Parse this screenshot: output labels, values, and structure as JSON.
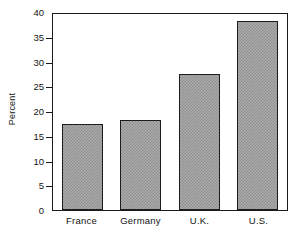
{
  "chart_data": {
    "type": "bar",
    "title": "",
    "subtitle": "",
    "xlabel": "",
    "ylabel": "Percent",
    "categories": [
      "France",
      "Germany",
      "U.K.",
      "U.S."
    ],
    "values": [
      17.6,
      18.4,
      27.7,
      38.5
    ],
    "series": [
      {
        "name": "Percent",
        "values": [
          17.6,
          18.4,
          27.7,
          38.5
        ]
      }
    ],
    "ylim": [
      0,
      40
    ],
    "ytick_labels": [
      "40",
      "35",
      "30",
      "25",
      "20",
      "15",
      "10",
      "5",
      "0"
    ],
    "ytick_values": [
      40,
      35,
      30,
      25,
      20,
      15,
      10,
      5,
      0
    ],
    "xtick_labels": [
      "France",
      "Germany",
      "U.K.",
      "U.S."
    ],
    "grid": false,
    "legend": false,
    "legend_position": "none",
    "annotations": [],
    "colors": {
      "bar_fill": "#aaaaaa",
      "bar_pattern": "#8e8e8e",
      "bar_edge": "#1c1c1c",
      "axis": "#1a1a1a",
      "text": "#141414",
      "background": "#ffffff"
    }
  }
}
